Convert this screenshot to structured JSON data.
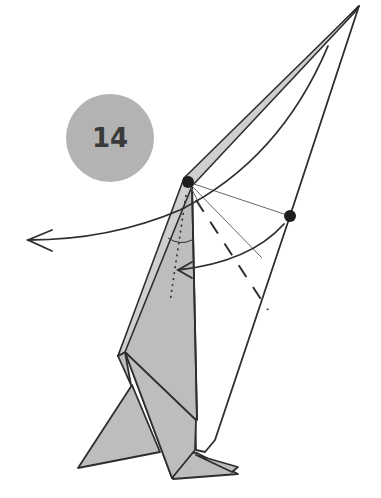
{
  "diagram": {
    "step": {
      "number": "14",
      "badge_color": "#b3b3b3",
      "text_color": "#3a3a3a",
      "center": [
        110,
        138
      ],
      "radius": 44
    },
    "colors": {
      "paper_fill": "#bdbdbd",
      "paper_fill_light": "#c8c8c8",
      "line": "#2e2e2e",
      "thin_line": "#666666",
      "background": "#ffffff"
    },
    "markers": [
      {
        "name": "pivot-point",
        "x": 188,
        "y": 182
      },
      {
        "name": "reference-point",
        "x": 290,
        "y": 216
      }
    ],
    "arrows": [
      {
        "name": "turn-over-arrow",
        "description": "long curved arrow sweeping left",
        "from": [
          325,
          45
        ],
        "to": [
          28,
          240
        ]
      },
      {
        "name": "fold-arrow",
        "description": "short arc from reference point to inner crease",
        "from": [
          285,
          225
        ],
        "to": [
          178,
          270
        ]
      }
    ],
    "lines": {
      "valley_fold": "dashed line from pivot downward",
      "existing_crease": "dotted line inside gray flap",
      "guide_lines": "thin lines from pivot to reference point"
    }
  }
}
